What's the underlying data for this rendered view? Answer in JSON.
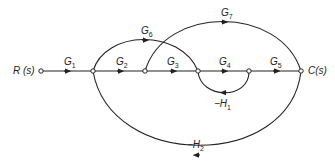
{
  "diagram": {
    "type": "signal-flow-graph",
    "input_label": "R (s)",
    "output_label": "C(s)",
    "nodes": [
      {
        "id": "R",
        "x": 41,
        "y": 71
      },
      {
        "id": "n1",
        "x": 93,
        "y": 71
      },
      {
        "id": "n2",
        "x": 145,
        "y": 71
      },
      {
        "id": "n3",
        "x": 198,
        "y": 71
      },
      {
        "id": "n4",
        "x": 249,
        "y": 71
      },
      {
        "id": "C",
        "x": 301,
        "y": 71
      }
    ],
    "branches": [
      {
        "from": "R",
        "to": "n1",
        "gain": "G",
        "sub": "1"
      },
      {
        "from": "n1",
        "to": "n2",
        "gain": "G",
        "sub": "2"
      },
      {
        "from": "n2",
        "to": "n3",
        "gain": "G",
        "sub": "3"
      },
      {
        "from": "n3",
        "to": "n4",
        "gain": "G",
        "sub": "4"
      },
      {
        "from": "n4",
        "to": "C",
        "gain": "G",
        "sub": "5"
      },
      {
        "from": "n1",
        "to": "n3",
        "gain": "G",
        "sub": "6"
      },
      {
        "from": "n2",
        "to": "C",
        "gain": "G",
        "sub": "7"
      },
      {
        "from": "n4",
        "to": "n3",
        "gain": "-H",
        "sub": "1"
      },
      {
        "from": "C",
        "to": "n1",
        "gain": "-H",
        "sub": "2"
      }
    ]
  },
  "labels": {
    "G1": {
      "main": "G",
      "sub": "1"
    },
    "G2": {
      "main": "G",
      "sub": "2"
    },
    "G3": {
      "main": "G",
      "sub": "3"
    },
    "G4": {
      "main": "G",
      "sub": "4"
    },
    "G5": {
      "main": "G",
      "sub": "5"
    },
    "G6": {
      "main": "G",
      "sub": "6"
    },
    "G7": {
      "main": "G",
      "sub": "7"
    },
    "H1": {
      "main": "−H",
      "sub": "1"
    },
    "H2": {
      "main": "−H",
      "sub": "2"
    },
    "R": "R (s)",
    "C": "C(s)"
  }
}
